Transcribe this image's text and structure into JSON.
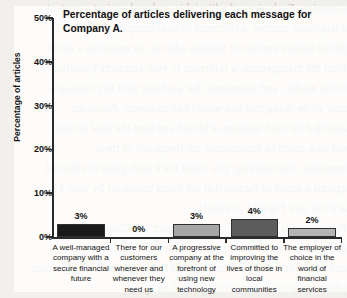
{
  "page": {
    "background_color": "#f2f0ec",
    "panel_color": "#ffffff",
    "ghost_text_lines": [
      "campaign. Each piece of editorial is analysed against a content",
      "a telephone number, a reference to your company's position",
      "phone hotline number or website address, an enquiries a quote",
      "from the management, a reference to your company's position",
      "in the market, and statements that anybody with key messages",
      "may all be doing that you would like to appear. Points are",
      "awarded for each mention achieved and then the total plotted",
      "out on a graph to demonstrate the frequency of these",
      "mentions. Alternatively, you could track each piece of editorial",
      "against a series of figures that are being broadcast by your PR",
      "activity (see Figure 1 overleaf).",
      "Publication is your next problem. Figure 1.3 Closest",
      "editorial to your key messages and the right publications",
      "and one which your readers are most likely to read with your plan",
      "which is the most effective. Channel and your"
    ]
  },
  "chart_data": {
    "type": "bar",
    "title": "Percentage of articles delivering each message for Company A.",
    "xlabel": "",
    "ylabel": "Percentage of articles",
    "ylim": [
      0,
      50
    ],
    "grid": false,
    "legend": null,
    "ytick_labels": [
      "0%",
      "10%",
      "20%",
      "30%",
      "40%",
      "50%"
    ],
    "ytick_values": [
      0,
      10,
      20,
      30,
      40,
      50
    ],
    "categories": [
      "A well-managed company with a secure financial future",
      "There for our customers wherever and whenever they need us",
      "A progressive company at the forefront of using new technology",
      "Committed to improving the lives of those in local communities",
      "The employer of choice in the world of financial services"
    ],
    "values": [
      3,
      0,
      3,
      4,
      2
    ],
    "value_labels": [
      "3%",
      "0%",
      "3%",
      "4%",
      "2%"
    ],
    "bar_colors": [
      "#1a1a1a",
      "#ffffff",
      "#a6a6a6",
      "#5c5c5c",
      "#b5b5b5"
    ]
  }
}
